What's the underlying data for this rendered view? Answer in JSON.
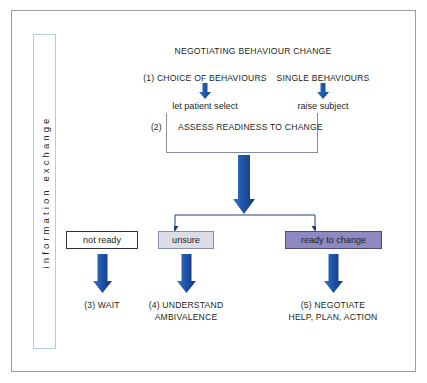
{
  "diagram": {
    "title": "NEGOTIATING BEHAVIOUR CHANGE",
    "side_label": "information exchange",
    "branches": {
      "left_header": "(1) CHOICE OF BEHAVIOURS",
      "right_header": "SINGLE BEHAVIOURS",
      "left_action": "let patient select",
      "right_action": "raise subject"
    },
    "assess": {
      "step_number": "(2)",
      "label": "ASSESS READINESS TO CHANGE"
    },
    "outcomes": [
      {
        "label": "not ready",
        "result_line1": "(3) WAIT",
        "result_line2": ""
      },
      {
        "label": "unsure",
        "result_line1": "(4) UNDERSTAND",
        "result_line2": "AMBIVALENCE"
      },
      {
        "label": "ready to change",
        "result_line1": "(5) NEGOTIATE",
        "result_line2": "HELP, PLAN, ACTION"
      }
    ],
    "colors": {
      "arrow_light": "#2f6fc4",
      "arrow_dark": "#1b3f87",
      "box_unsure_fill": "#dcdce8",
      "box_ready_fill": "#8e89c2",
      "box_notready_fill": "#ffffff",
      "frame_border": "#9d9d9d",
      "strip_border": "#b6ccdd",
      "bracket_border": "#7f8fa6",
      "connector": "#1f3f7a"
    }
  }
}
